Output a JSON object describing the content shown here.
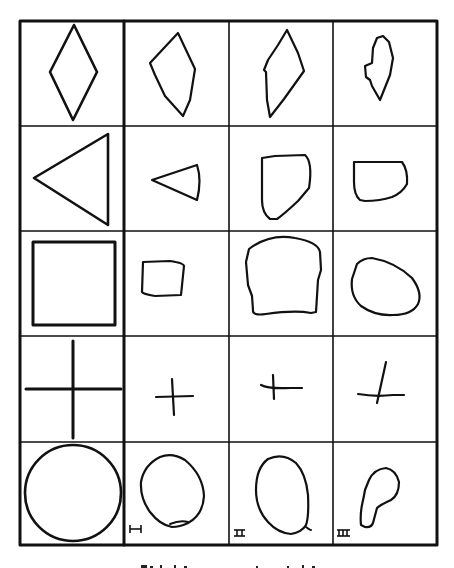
{
  "figure": {
    "rows": [
      {
        "model": "diamond",
        "copies": [
          "irregular diamond",
          "elongated diamond",
          "small lumpy diamond"
        ]
      },
      {
        "model": "triangle",
        "copies": [
          "small triangle",
          "rounded quadrilateral",
          "rounded rectangle"
        ]
      },
      {
        "model": "square",
        "copies": [
          "small square",
          "large rounded square",
          "oval"
        ]
      },
      {
        "model": "cross",
        "copies": [
          "small cross",
          "small cross",
          "tilted cross"
        ]
      },
      {
        "model": "circle",
        "copies": [
          "oval",
          "teardrop",
          "pear shape"
        ]
      }
    ],
    "column_labels": [
      "I",
      "II",
      "III"
    ],
    "caption": ""
  },
  "colors": {
    "ink": "#111111",
    "paper": "#ffffff"
  }
}
